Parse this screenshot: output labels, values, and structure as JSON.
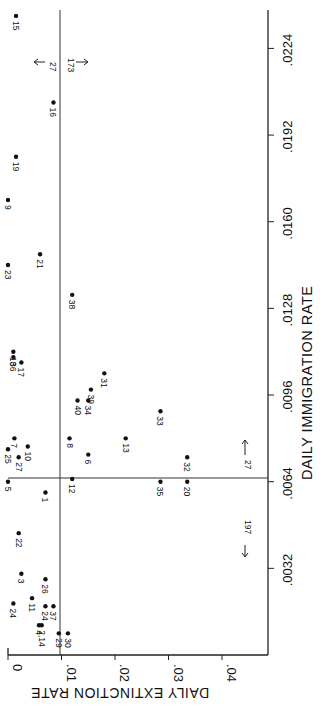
{
  "chart_data": {
    "type": "scatter",
    "orientation": "rotated-90-ccw",
    "title": "",
    "xlabel": "DAILY IMMIGRATION RATE",
    "ylabel": "DAILY EXTINCTION RATE",
    "xlim": [
      0.0,
      0.0245
    ],
    "ylim": [
      0.0,
      0.048
    ],
    "x_ticks": [
      ".0032",
      ".0064",
      ".0096",
      ".0128",
      ".0160",
      ".0192",
      ".0224"
    ],
    "x_tick_values": [
      0.0032,
      0.0064,
      0.0096,
      0.0128,
      0.016,
      0.0192,
      0.0224
    ],
    "y_ticks": [
      "0",
      ".01",
      ".02",
      ".03",
      ".04"
    ],
    "y_tick_values": [
      0.0,
      0.01,
      0.02,
      0.03,
      0.04
    ],
    "grid": false,
    "reference_lines": {
      "immigration": 0.0064,
      "extinction": 0.01
    },
    "points": [
      {
        "label": "15",
        "immigration": 0.0236,
        "extinction": 0.0015
      },
      {
        "label": "16",
        "immigration": 0.0204,
        "extinction": 0.0085
      },
      {
        "label": "19",
        "immigration": 0.0184,
        "extinction": 0.0015
      },
      {
        "label": "9",
        "immigration": 0.0168,
        "extinction": 0.0
      },
      {
        "label": "23",
        "immigration": 0.0144,
        "extinction": 0.0
      },
      {
        "label": "21",
        "immigration": 0.0148,
        "extinction": 0.006
      },
      {
        "label": "38",
        "immigration": 0.0133,
        "extinction": 0.012
      },
      {
        "label": "18",
        "immigration": 0.0112,
        "extinction": 0.001
      },
      {
        "label": "36",
        "immigration": 0.011,
        "extinction": 0.001
      },
      {
        "label": "17",
        "immigration": 0.0108,
        "extinction": 0.0025
      },
      {
        "label": "31",
        "immigration": 0.0104,
        "extinction": 0.018
      },
      {
        "label": "39",
        "immigration": 0.0098,
        "extinction": 0.0155
      },
      {
        "label": "40",
        "immigration": 0.0094,
        "extinction": 0.013
      },
      {
        "label": "34",
        "immigration": 0.0094,
        "extinction": 0.015
      },
      {
        "label": "33",
        "immigration": 0.009,
        "extinction": 0.0285
      },
      {
        "label": "7",
        "immigration": 0.008,
        "extinction": 0.0012
      },
      {
        "label": "10",
        "immigration": 0.0077,
        "extinction": 0.0037
      },
      {
        "label": "25",
        "immigration": 0.0076,
        "extinction": 0.0
      },
      {
        "label": "27",
        "immigration": 0.0073,
        "extinction": 0.002
      },
      {
        "label": "5",
        "immigration": 0.0064,
        "extinction": 0.0
      },
      {
        "label": "8",
        "immigration": 0.008,
        "extinction": 0.0115
      },
      {
        "label": "13",
        "immigration": 0.008,
        "extinction": 0.022
      },
      {
        "label": "6",
        "immigration": 0.0074,
        "extinction": 0.015
      },
      {
        "label": "12",
        "immigration": 0.0065,
        "extinction": 0.012
      },
      {
        "label": "32",
        "immigration": 0.0073,
        "extinction": 0.0335
      },
      {
        "label": "35",
        "immigration": 0.0064,
        "extinction": 0.0285
      },
      {
        "label": "20",
        "immigration": 0.0064,
        "extinction": 0.0335
      },
      {
        "label": "1",
        "immigration": 0.006,
        "extinction": 0.007
      },
      {
        "label": "22",
        "immigration": 0.0045,
        "extinction": 0.002
      },
      {
        "label": "3",
        "immigration": 0.003,
        "extinction": 0.0025
      },
      {
        "label": "26",
        "immigration": 0.0028,
        "extinction": 0.007
      },
      {
        "label": "11",
        "immigration": 0.0021,
        "extinction": 0.0045
      },
      {
        "label": "24",
        "immigration": 0.0019,
        "extinction": 0.001
      },
      {
        "label": "24",
        "immigration": 0.0018,
        "extinction": 0.007
      },
      {
        "label": "37",
        "immigration": 0.0018,
        "extinction": 0.0085
      },
      {
        "label": "4",
        "immigration": 0.0011,
        "extinction": 0.0058
      },
      {
        "label": "2,14",
        "immigration": 0.0011,
        "extinction": 0.0063
      },
      {
        "label": "29",
        "immigration": 0.0008,
        "extinction": 0.0095
      },
      {
        "label": "30",
        "immigration": 0.0008,
        "extinction": 0.0112
      }
    ],
    "off_scale_annotations": [
      {
        "text": "27",
        "direction": "immigration-high",
        "note": "arrow pointing beyond top immigration"
      },
      {
        "text": "173",
        "direction": "immigration-high-right",
        "note": "arrow pointing to higher extinction"
      },
      {
        "text": "27",
        "direction": "extinction-high",
        "note": "arrow toward higher immigration"
      },
      {
        "text": "197",
        "direction": "extinction-high-low-imm",
        "note": "arrow toward lower immigration"
      }
    ]
  }
}
